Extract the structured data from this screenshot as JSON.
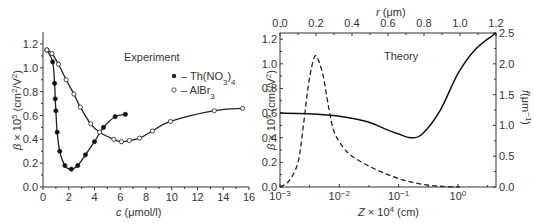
{
  "chart_data": [
    {
      "type": "line",
      "panel": "left",
      "title": "Experiment",
      "xlabel": "c (μmol/l)",
      "ylabel": "β × 10⁵ (cm²/V²)",
      "xlim": [
        0,
        16
      ],
      "ylim": [
        0,
        1.2
      ],
      "xticks": [
        "0",
        "2",
        "4",
        "6",
        "8",
        "10",
        "12",
        "14",
        "16"
      ],
      "yticks": [
        "0.0",
        "0.2",
        "0.4",
        "0.6",
        "0.8",
        "1.0",
        "1.2"
      ],
      "legend": [
        "– Th(NO₃)₄",
        "– AlBr₃"
      ],
      "series": [
        {
          "name": "Th(NO3)4",
          "marker": "filled-circle",
          "x": [
            0.3,
            0.75,
            0.9,
            0.95,
            1.0,
            1.1,
            1.3,
            1.7,
            2.2,
            2.7,
            3.3,
            4.0,
            4.7,
            5.6,
            6.4
          ],
          "y": [
            1.15,
            1.05,
            0.87,
            0.74,
            0.64,
            0.46,
            0.3,
            0.18,
            0.15,
            0.18,
            0.27,
            0.38,
            0.5,
            0.59,
            0.61
          ]
        },
        {
          "name": "AlBr3",
          "marker": "open-circle",
          "x": [
            0.3,
            0.7,
            1.2,
            1.8,
            2.4,
            2.9,
            3.7,
            4.4,
            5.5,
            6.1,
            6.7,
            7.5,
            8.5,
            9.9,
            13.3,
            15.5
          ],
          "y": [
            1.15,
            1.12,
            1.03,
            0.9,
            0.78,
            0.67,
            0.53,
            0.46,
            0.4,
            0.38,
            0.39,
            0.41,
            0.47,
            0.55,
            0.64,
            0.66
          ]
        }
      ]
    },
    {
      "type": "line",
      "panel": "right",
      "title": "Theory",
      "xlabel": "Z × 10⁴ (cm)",
      "xscale": "log",
      "xlim": [
        0.001,
        4.4
      ],
      "xticks": [
        "10⁻³",
        "10⁻²",
        "10⁻¹",
        "10⁰"
      ],
      "top_xlabel": "r (μm)",
      "top_xticks": [
        "0.0",
        "0.2",
        "0.4",
        "0.6",
        "0.8",
        "1.0",
        "1.2"
      ],
      "ylabel": "β × 10⁵ (cm²/V²)",
      "ylim": [
        0,
        1.25
      ],
      "yticks": [
        "0.0",
        "0.2",
        "0.4",
        "0.6",
        "0.8",
        "1.0",
        "1.2"
      ],
      "y2label": "f(μm⁻¹)",
      "y2lim": [
        0,
        2.5
      ],
      "y2ticks": [
        "0.0",
        "0.5",
        "1.0",
        "1.5",
        "2.0",
        "2.5"
      ],
      "series": [
        {
          "name": "β theory (solid, vs Z)",
          "style": "solid",
          "x": [
            0.001,
            0.003,
            0.01,
            0.03,
            0.06,
            0.1,
            0.16,
            0.25,
            0.5,
            1.0,
            2.0,
            4.4
          ],
          "y": [
            0.6,
            0.595,
            0.575,
            0.53,
            0.47,
            0.43,
            0.4,
            0.43,
            0.62,
            0.92,
            1.12,
            1.25
          ]
        },
        {
          "name": "f (dashed, vs r)",
          "style": "dashed",
          "axis": "right",
          "r": [
            0.0,
            0.05,
            0.1,
            0.13,
            0.16,
            0.19,
            0.21,
            0.24,
            0.27,
            0.3,
            0.35,
            0.4,
            0.5,
            0.6,
            0.7,
            0.8,
            0.9,
            1.0
          ],
          "y": [
            0.0,
            0.1,
            0.4,
            1.0,
            1.7,
            2.1,
            2.08,
            1.8,
            1.3,
            0.9,
            0.65,
            0.5,
            0.33,
            0.2,
            0.1,
            0.04,
            0.01,
            0.0
          ]
        }
      ]
    }
  ],
  "labels": {
    "left_title": "Experiment",
    "left_xlabel": "c (μmol/l)",
    "left_ylabel": "β × 10⁵ (cm²/V²)",
    "legend_th": "– Th(NO₃)₄",
    "legend_al": "– AlBr₃",
    "right_title": "Theory",
    "right_xlabel": "Z × 10⁴ (cm)",
    "right_top_xlabel": "r (μm)",
    "right_ylabel": "β × 10⁵ (cm²/V²)",
    "right_y2label": "f(μm⁻¹)"
  }
}
